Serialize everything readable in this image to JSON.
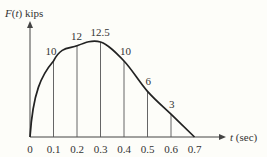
{
  "chart_data": {
    "type": "line",
    "title": "",
    "xlabel": "t (sec)",
    "ylabel": "F(t) kips",
    "ylabel_parts": {
      "var": "F",
      "open": "(",
      "arg": "t",
      "close": ")",
      "unit": " kips"
    },
    "xlabel_parts": {
      "var": "t",
      "unit": " (sec)"
    },
    "x": [
      0,
      0.1,
      0.2,
      0.3,
      0.4,
      0.5,
      0.6,
      0.7
    ],
    "x_tick_labels": [
      "0",
      "0.1",
      "0.2",
      "0.3",
      "0.4",
      "0.5",
      "0.6",
      "0.7"
    ],
    "values": [
      0,
      10,
      12,
      12.5,
      10,
      6,
      3,
      0
    ],
    "point_labels": [
      "",
      "10",
      "12",
      "12.5",
      "10",
      "6",
      "3",
      ""
    ],
    "xlim": [
      0,
      0.7
    ],
    "ylim": [
      0,
      12.5
    ],
    "grid": "vertical ordinates at each sample",
    "legend": "none"
  }
}
